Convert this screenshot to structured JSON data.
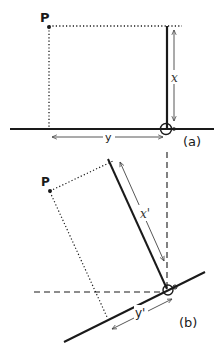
{
  "figure": {
    "panel_a": {
      "tag": "(a)",
      "point_label": "P",
      "vertical_distance_label": "x",
      "horizontal_distance_label": "y"
    },
    "panel_b": {
      "tag": "(b)",
      "point_label": "P",
      "rotated_vertical_distance_label": "x'",
      "rotated_horizontal_distance_label": "y'"
    }
  },
  "colors": {
    "ink": "#1a1a1a",
    "thin_ink": "#444444",
    "background": "#ffffff"
  }
}
